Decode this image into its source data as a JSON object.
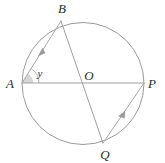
{
  "figure": {
    "type": "circle-geometry-diagram",
    "background_color": "#ffffff",
    "stroke_color": "#9a9a9a",
    "label_color": "#2b2b2b",
    "shade_color": "#d6d6d6",
    "circle": {
      "center_x": 83,
      "center_y": 83.5,
      "radius": 61,
      "label": "circle"
    },
    "points": [
      {
        "id": "A",
        "label": "A",
        "x": 22,
        "y": 83,
        "label_x": 10,
        "label_y": 85,
        "role": "left endpoint of horizontal diameter AP"
      },
      {
        "id": "B",
        "label": "B",
        "x": 61,
        "y": 21,
        "label_x": 62,
        "label_y": 10,
        "role": "top endpoint of diameter BQ"
      },
      {
        "id": "O",
        "label": "O",
        "x": 83,
        "y": 83.5,
        "label_x": 89,
        "label_y": 77,
        "role": "center of circle"
      },
      {
        "id": "P",
        "label": "P",
        "x": 144,
        "y": 83,
        "label_x": 152,
        "label_y": 85,
        "role": "right endpoint of horizontal diameter AP"
      },
      {
        "id": "Q",
        "label": "Q",
        "x": 103,
        "y": 143,
        "label_x": 105,
        "label_y": 156,
        "role": "bottom endpoint of diameter BQ"
      }
    ],
    "segments": [
      {
        "id": "AP",
        "from": "A",
        "to": "P",
        "kind": "diameter",
        "x1": 22,
        "y1": 83,
        "x2": 144,
        "y2": 83
      },
      {
        "id": "BQ",
        "from": "B",
        "to": "Q",
        "kind": "diameter",
        "x1": 61,
        "y1": 21,
        "x2": 103,
        "y2": 143
      },
      {
        "id": "AB",
        "from": "A",
        "to": "B",
        "kind": "ray",
        "x1": 22,
        "y1": 83,
        "x2": 61,
        "y2": 21
      },
      {
        "id": "QP",
        "from": "Q",
        "to": "P",
        "kind": "ray",
        "x1": 103,
        "y1": 143,
        "x2": 144,
        "y2": 83
      }
    ],
    "arrows": [
      {
        "id": "arrow-AB",
        "on_segment": "AB",
        "tip_x": 42.5,
        "tip_y": 48,
        "angle_deg": -57.8,
        "direction": "toward B"
      },
      {
        "id": "arrow-QP",
        "on_segment": "QP",
        "tip_x": 125,
        "tip_y": 111,
        "angle_deg": -55.7,
        "direction": "toward P"
      }
    ],
    "angles": [
      {
        "id": "angle-y",
        "label": "y",
        "vertex": "A",
        "between": [
          "AP",
          "AB"
        ],
        "measure_deg": 57.8,
        "shaded": true,
        "label_x": 40,
        "label_y": 74,
        "arc_radius": 17,
        "sector_radius": 11
      }
    ]
  }
}
